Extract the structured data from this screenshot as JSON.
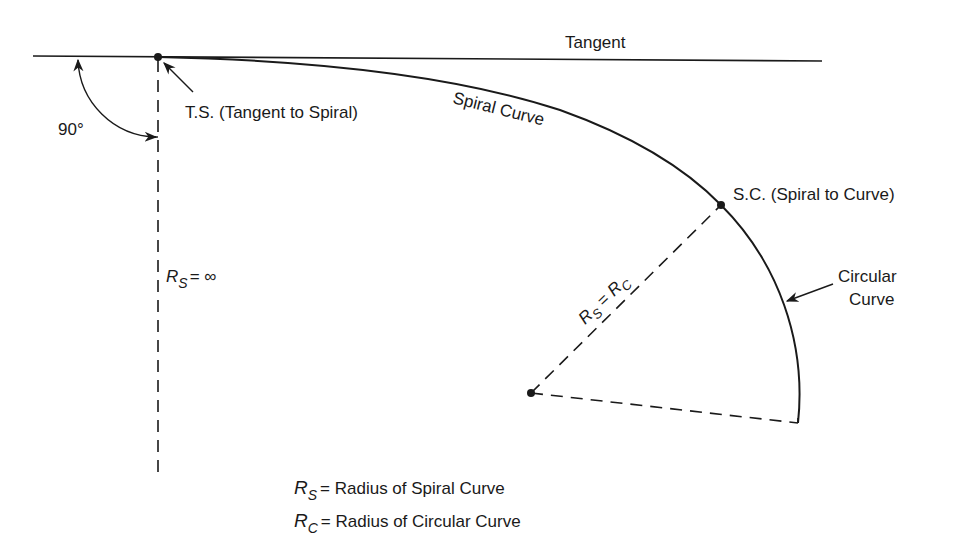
{
  "diagram": {
    "colors": {
      "ink": "#1a1a1a",
      "background": "#ffffff"
    },
    "labels": {
      "tangent": "Tangent",
      "ts": "T.S. (Tangent to Spiral)",
      "spiral_curve": "Spiral Curve",
      "sc": "S.C. (Spiral to Curve)",
      "circular_line1": "Circular",
      "circular_line2": "Curve",
      "angle": "90°",
      "rs_inf": {
        "symbol": "R",
        "subscript": "S",
        "rest": "= ∞"
      },
      "rs_rc": {
        "r1": "R",
        "s1": "S",
        "eq": " = ",
        "r2": "R",
        "s2": "C"
      }
    },
    "legend": [
      {
        "symbol": "R",
        "subscript": "S",
        "text": "=  Radius of Spiral Curve"
      },
      {
        "symbol": "R",
        "subscript": "C",
        "text": "=  Radius of Circular Curve"
      }
    ],
    "points": [
      {
        "name": "T.S.",
        "x": 158,
        "y": 57
      },
      {
        "name": "S.C.",
        "x": 721,
        "y": 205
      },
      {
        "name": "center",
        "x": 531,
        "y": 393
      }
    ]
  }
}
